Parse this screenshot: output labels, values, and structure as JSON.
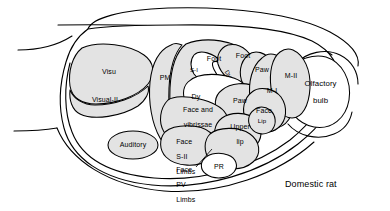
{
  "figure": {
    "title": "Domestic rat",
    "caption": "Domestic rat",
    "species_label": "Domestic rat",
    "view": "lateral view of cerebral cortex with functional area map",
    "colors": {
      "region_fill": "#e3e3e3",
      "background": "#ffffff",
      "outline": "#000000"
    }
  },
  "regions": [
    {
      "id": "visu",
      "label": "Visu",
      "kind": "sensory-visual"
    },
    {
      "id": "visual-ii",
      "label": "Visual-II",
      "kind": "sensory-visual"
    },
    {
      "id": "auditory",
      "label": "Auditory",
      "kind": "sensory-auditory"
    },
    {
      "id": "pm",
      "label": "PM",
      "kind": "somatosensory"
    },
    {
      "id": "s-i",
      "label": "S-I",
      "kind": "somatosensory"
    },
    {
      "id": "foot-upper",
      "label": "Foot",
      "kind": "somatosensory"
    },
    {
      "id": "foot-lower",
      "label": "Foot",
      "kind": "somatosensory"
    },
    {
      "id": "dy-rot",
      "label": "Dy",
      "kind": "somatosensory"
    },
    {
      "id": "dy",
      "label": "Dy",
      "kind": "somatosensory"
    },
    {
      "id": "paw-upper",
      "label": "Paw",
      "kind": "somatosensory"
    },
    {
      "id": "paw-lower",
      "label": "Paw",
      "kind": "somatosensory"
    },
    {
      "id": "m-i",
      "label": "M-I",
      "kind": "motor"
    },
    {
      "id": "m-ii",
      "label": "M-II",
      "kind": "motor"
    },
    {
      "id": "face",
      "label": "Face",
      "kind": "somatosensory"
    },
    {
      "id": "face-vibrissae",
      "label": "Face and\nvibrissae",
      "kind": "somatosensory"
    },
    {
      "id": "face-sii-limbs",
      "label": "Face\nS-II\nLimbs",
      "kind": "somatosensory"
    },
    {
      "id": "face-pv-limbs",
      "label": "Face\nPV\nLimbs",
      "kind": "somatosensory"
    },
    {
      "id": "upper-lip",
      "label": "Upper\nlip",
      "kind": "somatosensory"
    },
    {
      "id": "lip",
      "label": "Lip",
      "kind": "somatosensory"
    },
    {
      "id": "pr",
      "label": "PR",
      "kind": "somatosensory"
    },
    {
      "id": "olfactory-bulb",
      "label": "Olfactory\nbulb",
      "kind": "olfactory"
    }
  ],
  "labels": {
    "visu": "Visu",
    "visual_ii": "Visual-II",
    "auditory": "Auditory",
    "pm": "PM",
    "s_i": "S-I",
    "foot_upper": "Foot",
    "foot_lower": "Foot",
    "dy_rot": "Dy",
    "dy": "Dy",
    "paw_upper": "Paw",
    "paw_lower": "Paw",
    "m_i": "M-I",
    "m_ii": "M-II",
    "face": "Face",
    "face_vibrissae_line1": "Face and",
    "face_vibrissae_line2": "vibrissae",
    "face_sii_limbs_line1": "Face",
    "face_sii_limbs_line2": "S-II",
    "face_sii_limbs_line3": "Limbs",
    "face_pv_limbs_line1": "Face",
    "face_pv_limbs_line2": "PV",
    "face_pv_limbs_line3": "Limbs",
    "upper_lip_line1": "Upper",
    "upper_lip_line2": "lip",
    "lip": "Lip",
    "pr": "PR",
    "olfactory_bulb_line1": "Olfactory",
    "olfactory_bulb_line2": "bulb",
    "species": "Domestic rat"
  }
}
